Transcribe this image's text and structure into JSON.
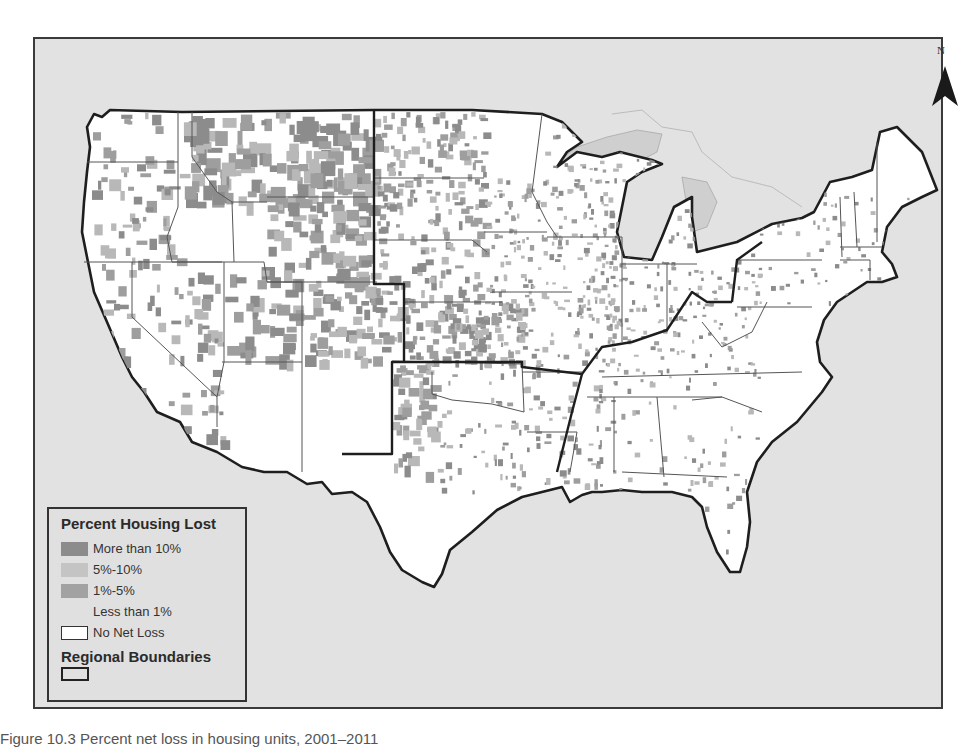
{
  "map": {
    "type": "choropleth",
    "extent": "Contiguous United States",
    "colors": {
      "ocean": "#e2e2e2",
      "land_no_loss": "#ffffff",
      "more_than_10": "#8c8c8c",
      "pct_5_10": "#b8b8b8",
      "pct_1_5": "#9e9e9e",
      "less_than_1": "#e0e0e0",
      "state_border": "#555555",
      "region_border": "#222222",
      "lakes": "#cfcfcf"
    },
    "north_arrow": {
      "label": "N",
      "icon": "north-arrow-icon"
    }
  },
  "legend": {
    "title": "Percent Housing Lost",
    "items": [
      {
        "label": "More than 10%",
        "color": "#8c8c8c"
      },
      {
        "label": "5%-10%",
        "color": "#c4c4c4"
      },
      {
        "label": "1%-5%",
        "color": "#a2a2a2"
      },
      {
        "label": "Less than 1%",
        "color": "#e0e0e0"
      },
      {
        "label": "No Net Loss",
        "color": "#ffffff"
      }
    ],
    "region_title": "Regional Boundaries"
  },
  "caption": "Figure 10.3 Percent net loss in housing units, 2001–2011"
}
